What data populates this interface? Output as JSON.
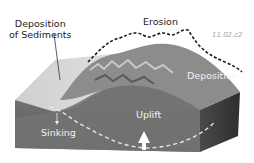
{
  "figure": {
    "id": "11.02.c2",
    "labels": {
      "deposition_sediments_line1": "Deposition",
      "deposition_sediments_line2": "of Sediments",
      "erosion": "Erosion",
      "deposition": "Deposition",
      "sinking": "Sinking",
      "uplift": "Uplift"
    },
    "colors": {
      "surface_sediment": "#d6d6d6",
      "block_front": "#6e6e6e",
      "block_side": "#3e3e3e",
      "mountain": "#8a8a8a",
      "dashed_line": "#1a1a1a",
      "subsurface_dash": "#e6e6e6"
    }
  }
}
